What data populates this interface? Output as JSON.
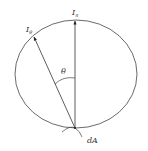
{
  "diagram": {
    "title": "",
    "labels": {
      "normal_intensity": "I",
      "normal_intensity_sub": "n",
      "angled_intensity": "I",
      "angled_intensity_sub": "θ",
      "angle": "θ",
      "area_element": "dA"
    },
    "colors": {
      "stroke": "#333333",
      "background": "#ffffff"
    }
  }
}
